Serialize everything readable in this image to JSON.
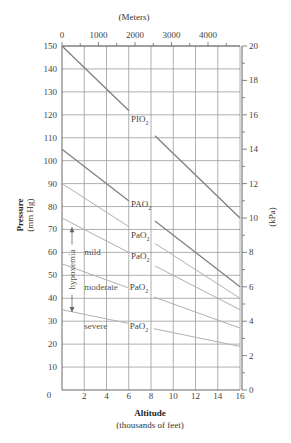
{
  "chart_data": {
    "type": "line",
    "title": "",
    "xlabel": "Altitude",
    "xlabel_sub": "(thousands of feet)",
    "ylabel": "Pressure",
    "ylabel_sub": "(mm Hg)",
    "y2label": "(kPa)",
    "x2label": "(Meters)",
    "xlim": [
      0,
      16
    ],
    "ylim": [
      0,
      150
    ],
    "y2lim": [
      0,
      20
    ],
    "grid": true,
    "x_ticks": [
      2,
      4,
      6,
      8,
      10,
      12,
      14,
      16
    ],
    "x_origin_label": "0",
    "y_ticks": [
      10,
      20,
      30,
      40,
      50,
      60,
      70,
      80,
      90,
      100,
      110,
      120,
      130,
      140,
      150
    ],
    "y2_ticks": [
      0,
      2,
      4,
      6,
      8,
      10,
      12,
      14,
      16,
      18,
      20
    ],
    "x2_ticks": [
      0,
      1000,
      2000,
      3000,
      4000
    ],
    "x": [
      0,
      16
    ],
    "series": [
      {
        "name": "PIO2",
        "label_main": "PIO",
        "values": [
          150,
          75
        ],
        "color": "#808080",
        "label_pos": [
          6.2,
          118
        ]
      },
      {
        "name": "PAO2",
        "label_main": "PAO",
        "values": [
          105,
          45
        ],
        "color": "#808080",
        "label_pos": [
          6.2,
          81
        ]
      },
      {
        "name": "PaO2 (normal)",
        "label_main": "PaO",
        "values": [
          90,
          40
        ],
        "color": "#b0b0b0",
        "label_pos": [
          6.2,
          67.5
        ]
      },
      {
        "name": "PaO2 (mild hypoxemia)",
        "label_main": "PaO",
        "values": [
          75,
          35
        ],
        "color": "#b0b0b0",
        "label_pos": [
          6.2,
          58.5
        ]
      },
      {
        "name": "PaO2 (moderate hypoxemia)",
        "label_main": "PaO",
        "values": [
          55,
          27
        ],
        "color": "#b0b0b0",
        "label_pos": [
          6.1,
          45
        ]
      },
      {
        "name": "PaO2 (severe hypoxemia)",
        "label_main": "PaO",
        "values": [
          35,
          19
        ],
        "color": "#b0b0b0",
        "label_pos": [
          6.1,
          28
        ]
      }
    ],
    "annotations": [
      {
        "text": "hypoxemia",
        "type": "vertical-arrow",
        "x": 0.9,
        "y_from": 71,
        "y_to": 34
      },
      {
        "text": "mild",
        "x": 2.0,
        "y": 60
      },
      {
        "text": "moderate",
        "x": 2.0,
        "y": 45
      },
      {
        "text": "severe",
        "x": 2.0,
        "y": 28
      }
    ]
  }
}
